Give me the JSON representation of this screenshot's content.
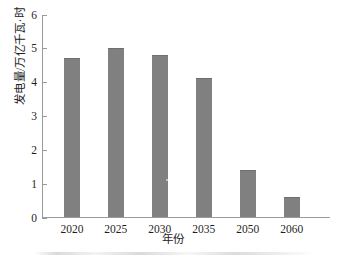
{
  "chart_data": {
    "type": "bar",
    "title": "",
    "subtitle": "",
    "xlabel": "年份",
    "ylabel": "发电量/万亿千瓦·时",
    "categories": [
      "2020",
      "2025",
      "2030",
      "2035",
      "2050",
      "2060"
    ],
    "values": [
      4.7,
      5.0,
      4.8,
      4.1,
      1.4,
      0.6
    ],
    "series": [
      {
        "name": "发电量",
        "values": [
          4.7,
          5.0,
          4.8,
          4.1,
          1.4,
          0.6
        ]
      }
    ],
    "ylim": [
      0,
      6
    ],
    "xlim_categories": [
      "2020",
      "2060"
    ],
    "yticks": [
      "0",
      "1",
      "2",
      "3",
      "4",
      "5",
      "6"
    ],
    "ytick_values": [
      0,
      1,
      2,
      3,
      4,
      5,
      6
    ],
    "xtick_labels": [
      "2020",
      "2025",
      "2030",
      "2035",
      "2050",
      "2060"
    ],
    "grid": false,
    "legend": null,
    "legend_position": "none",
    "bar_color": "#808080",
    "axis_color": "#9a9a9a",
    "text_color": "#1f1f1f",
    "background_color": "#ffffff",
    "annotations": []
  }
}
